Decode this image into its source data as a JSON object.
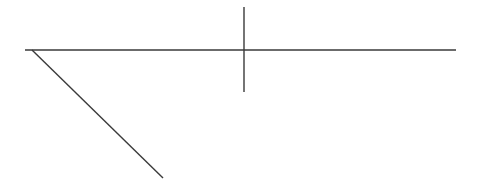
{
  "canvas": {
    "width": 486,
    "height": 188,
    "background": "#ffffff"
  },
  "stroke": {
    "color": "#3a3a3a",
    "width": 1.4
  },
  "lines": [
    {
      "name": "horizontal-line",
      "x1": 25,
      "y1": 50,
      "x2": 456,
      "y2": 50
    },
    {
      "name": "vertical-line",
      "x1": 244,
      "y1": 7,
      "x2": 244,
      "y2": 92
    },
    {
      "name": "diagonal-line",
      "x1": 32,
      "y1": 50,
      "x2": 163,
      "y2": 178
    }
  ]
}
